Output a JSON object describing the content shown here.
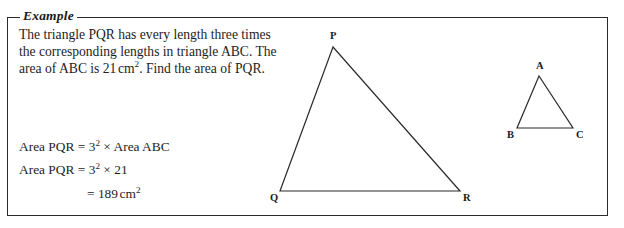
{
  "example_box": {
    "legend_label": "Example"
  },
  "problem": {
    "lines": [
      "The triangle PQR has every length three times",
      "the corresponding lengths in triangle ABC. The",
      "area of ABC is 21 cm². Find the area of PQR."
    ],
    "line3_prefix": "area of ABC is 21",
    "line3_unit": "cm",
    "line3_unit_exponent": "2",
    "line3_suffix": ". Find the area of PQR."
  },
  "working": {
    "line1": {
      "lhs": "Area PQR",
      "equals": "=",
      "base": "3",
      "exponent": "2",
      "times": "×",
      "rhs": "Area ABC"
    },
    "line2": {
      "lhs": "Area PQR",
      "equals": "=",
      "base": "3",
      "exponent": "2",
      "times": "×",
      "rhs": "21"
    },
    "line3": {
      "equals": "=",
      "value": "189",
      "unit": "cm",
      "unit_exponent": "2"
    }
  },
  "figures": {
    "large_triangle": {
      "name": "triangle PQR",
      "vertices": [
        {
          "label": "P",
          "x": 333,
          "y": 47,
          "label_x": 330,
          "label_y": 31
        },
        {
          "label": "Q",
          "x": 280,
          "y": 191,
          "label_x": 270,
          "label_y": 193
        },
        {
          "label": "R",
          "x": 460,
          "y": 191,
          "label_x": 463,
          "label_y": 193
        }
      ]
    },
    "small_triangle": {
      "name": "triangle ABC",
      "vertices": [
        {
          "label": "A",
          "x": 539,
          "y": 76,
          "label_x": 536,
          "label_y": 61
        },
        {
          "label": "B",
          "x": 517,
          "y": 128,
          "label_x": 507,
          "label_y": 130
        },
        {
          "label": "C",
          "x": 573,
          "y": 128,
          "label_x": 576,
          "label_y": 130
        }
      ]
    }
  },
  "colors": {
    "border": "#2b2b2b",
    "ink": "#1d1d1d",
    "page": "#ffffff"
  }
}
